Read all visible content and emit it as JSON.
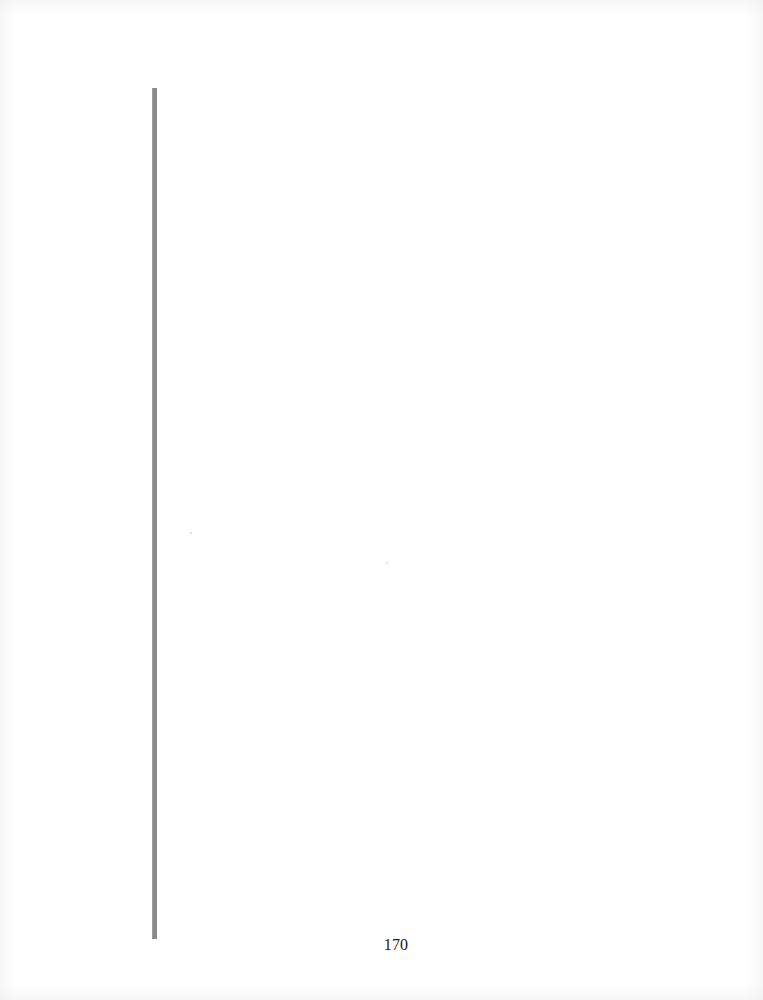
{
  "page": {
    "number": "170",
    "background_color": "#ffffff",
    "rule_color": "#8a8a8a"
  }
}
